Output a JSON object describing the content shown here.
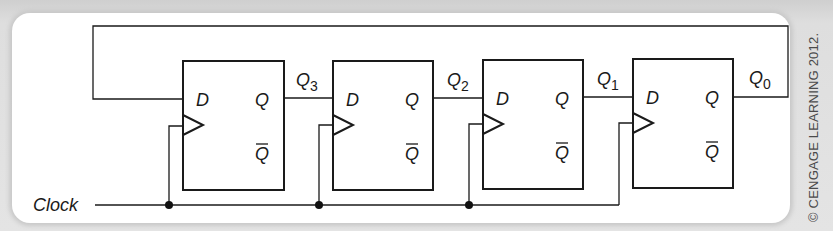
{
  "figure": {
    "type": "4-bit ring counter (D flip-flops)",
    "copyright": "© CENGAGE LEARNING 2012.",
    "clock_label": "Clock",
    "flip_flops": [
      {
        "id": "ff1",
        "input_label": "D",
        "output_label": "Q",
        "inverted_output_label": "Q",
        "output_signal": "Q",
        "output_subscript": "3"
      },
      {
        "id": "ff2",
        "input_label": "D",
        "output_label": "Q",
        "inverted_output_label": "Q",
        "output_signal": "Q",
        "output_subscript": "2"
      },
      {
        "id": "ff3",
        "input_label": "D",
        "output_label": "Q",
        "inverted_output_label": "Q",
        "output_signal": "Q",
        "output_subscript": "1"
      },
      {
        "id": "ff4",
        "input_label": "D",
        "output_label": "Q",
        "inverted_output_label": "Q",
        "output_signal": "Q",
        "output_subscript": "0"
      }
    ],
    "colors": {
      "wire": "#1a1a1a",
      "panel": "#ffffff",
      "background": "#dcdcdc"
    }
  }
}
